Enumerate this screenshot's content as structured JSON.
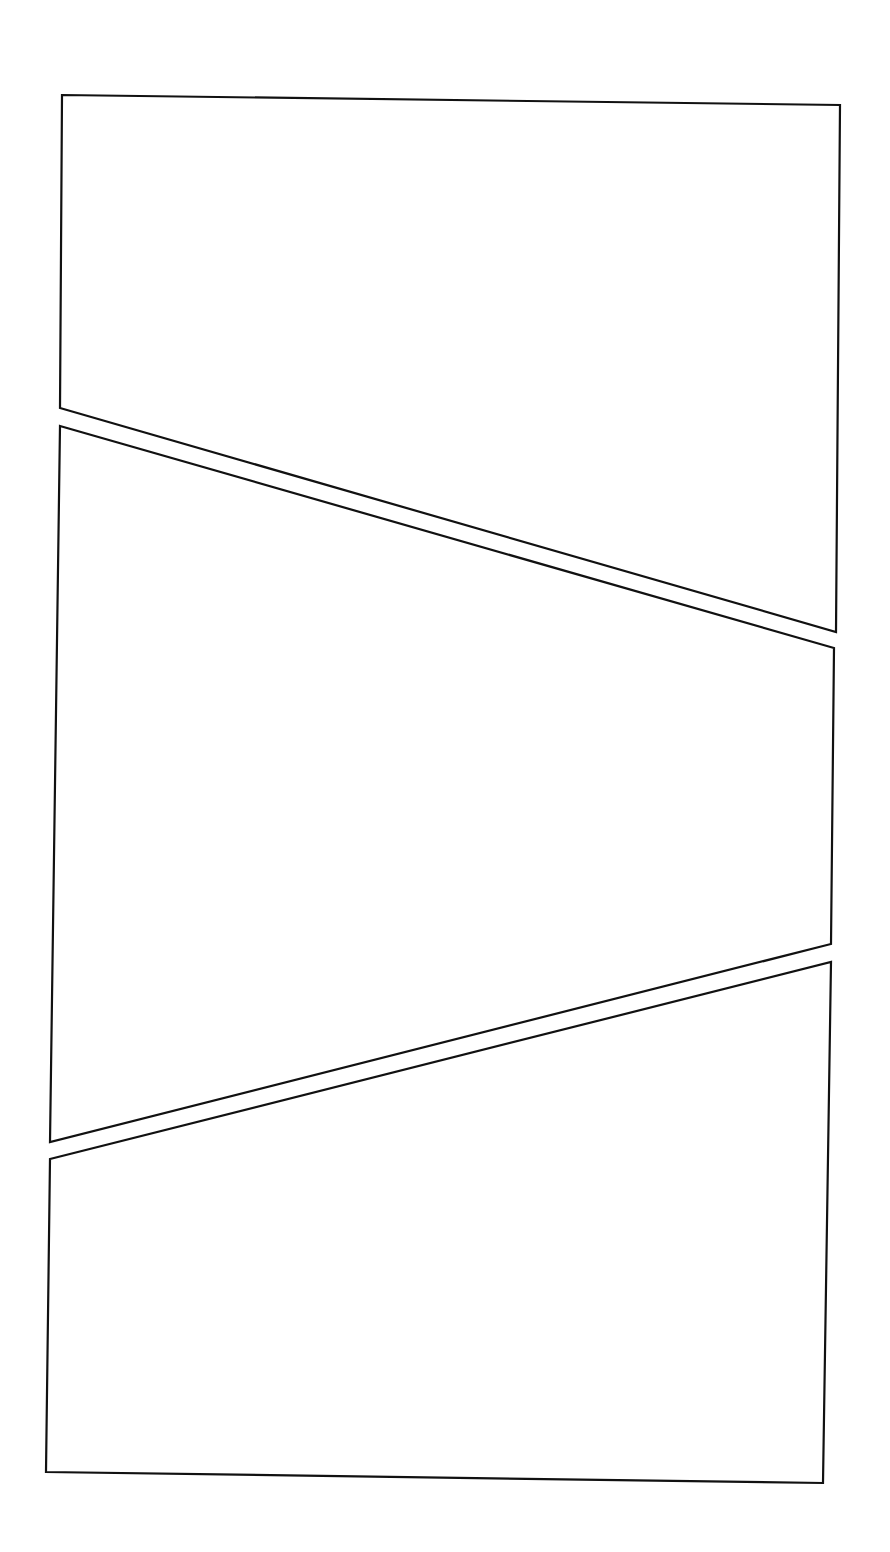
{
  "page": {
    "type": "comic-page-template",
    "background_color": "#ffffff",
    "border_color": "#111111"
  },
  "panels": [
    {
      "id": "panel-1",
      "label": ""
    },
    {
      "id": "panel-2",
      "label": ""
    },
    {
      "id": "panel-3",
      "label": ""
    }
  ]
}
